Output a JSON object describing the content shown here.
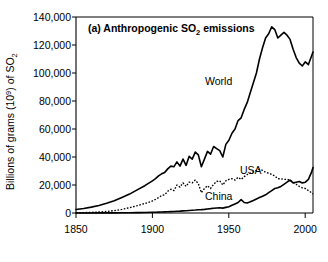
{
  "figure": {
    "panel_title": "(a) Anthropogenic SO",
    "panel_title_sub": "2",
    "panel_title_tail": " emissions",
    "ylabel_head": "Billions of grams (10",
    "ylabel_sup": "9",
    "ylabel_mid": ") of SO",
    "ylabel_sub": "2",
    "background_color": "#ffffff",
    "line_color": "#000000"
  },
  "axes": {
    "x_ticks": [
      "1850",
      "1900",
      "1950",
      "2000"
    ],
    "x_tick_values": [
      1850,
      1900,
      1950,
      2000
    ],
    "y_ticks": [
      "0",
      "20,000",
      "40,000",
      "60,000",
      "80,000",
      "100,000",
      "120,000",
      "140,000"
    ],
    "y_tick_values": [
      0,
      20000,
      40000,
      60000,
      80000,
      100000,
      120000,
      140000
    ],
    "xlim": [
      1850,
      2005
    ],
    "ylim": [
      0,
      140000
    ],
    "grid": false
  },
  "series_labels": {
    "world": "World",
    "usa": "USA",
    "china": "China"
  },
  "chart_data": {
    "type": "line",
    "title": "(a) Anthropogenic SO2 emissions",
    "xlabel": "",
    "ylabel": "Billions of grams (10^9) of SO2",
    "xlim": [
      1850,
      2005
    ],
    "ylim": [
      0,
      140000
    ],
    "grid": false,
    "legend_position": "inline-annotations",
    "x": [
      1850,
      1855,
      1860,
      1865,
      1870,
      1875,
      1880,
      1885,
      1890,
      1895,
      1900,
      1902,
      1904,
      1906,
      1908,
      1910,
      1912,
      1914,
      1916,
      1918,
      1920,
      1922,
      1924,
      1926,
      1928,
      1930,
      1932,
      1934,
      1936,
      1938,
      1940,
      1942,
      1944,
      1946,
      1948,
      1950,
      1952,
      1954,
      1956,
      1958,
      1960,
      1962,
      1964,
      1966,
      1968,
      1970,
      1972,
      1974,
      1976,
      1978,
      1980,
      1982,
      1984,
      1986,
      1988,
      1990,
      1992,
      1994,
      1996,
      1998,
      2000,
      2002,
      2004,
      2005
    ],
    "series": [
      {
        "name": "World",
        "style": "solid",
        "values": [
          2500,
          3200,
          4200,
          5400,
          7000,
          8800,
          11000,
          13500,
          16500,
          19500,
          23000,
          24500,
          26500,
          28000,
          29000,
          31500,
          33500,
          33000,
          36500,
          33500,
          38500,
          34000,
          40500,
          38500,
          43500,
          41500,
          33000,
          38500,
          44000,
          42000,
          47500,
          46000,
          44500,
          40000,
          49000,
          52000,
          57000,
          60000,
          66000,
          68000,
          74000,
          79000,
          86000,
          93000,
          100000,
          110000,
          118000,
          125000,
          128000,
          133000,
          131000,
          125000,
          127000,
          129000,
          127000,
          124000,
          117000,
          111000,
          107000,
          105000,
          108000,
          106000,
          112000,
          115000
        ]
      },
      {
        "name": "USA",
        "style": "dotted",
        "values": [
          100,
          250,
          450,
          700,
          1100,
          1700,
          2600,
          3800,
          5200,
          6800,
          8600,
          9700,
          11000,
          12500,
          13000,
          15500,
          17000,
          16000,
          20000,
          18500,
          21500,
          19000,
          22000,
          21500,
          23500,
          21000,
          14500,
          17500,
          19500,
          17500,
          20500,
          22500,
          23000,
          20000,
          23000,
          24000,
          24500,
          23500,
          25500,
          24000,
          26000,
          27500,
          28500,
          29500,
          30500,
          31200,
          30500,
          29000,
          28500,
          27500,
          26500,
          24500,
          24500,
          24000,
          24000,
          23500,
          22000,
          20500,
          19000,
          18000,
          17500,
          16000,
          14500,
          13500
        ]
      },
      {
        "name": "China",
        "style": "solid",
        "values": [
          20,
          30,
          45,
          60,
          80,
          110,
          150,
          200,
          280,
          380,
          500,
          560,
          640,
          720,
          800,
          900,
          1000,
          1100,
          1250,
          1350,
          1500,
          1650,
          1800,
          1950,
          2100,
          2300,
          2400,
          2600,
          2900,
          3100,
          3400,
          3600,
          3700,
          3500,
          4000,
          4500,
          5500,
          6500,
          7500,
          9500,
          7500,
          7200,
          8000,
          9000,
          10000,
          11000,
          12000,
          13000,
          14500,
          16000,
          17500,
          18000,
          19000,
          20500,
          22000,
          23500,
          21500,
          22000,
          22500,
          21500,
          22000,
          24000,
          29000,
          32500
        ]
      }
    ],
    "annotations": [
      {
        "text": "World",
        "x": 1963,
        "y": 79000
      },
      {
        "text": "USA",
        "x": 1972,
        "y": 33500
      },
      {
        "text": "China",
        "x": 1960,
        "y": 10500
      }
    ]
  }
}
